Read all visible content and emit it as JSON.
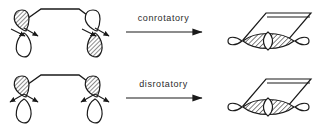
{
  "figure": {
    "background_color": "#ffffff",
    "line_color": "#1a1a1a",
    "text_color": "#2b2b2b",
    "width": 323,
    "height": 132
  },
  "rows": [
    {
      "id": "conrotatory",
      "label": "conrotatory",
      "reactant": {
        "name": "butadiene-conrotatory",
        "description": "open-chain diene with two terminal p orbitals",
        "left_orbital": {
          "shaded_lobe": "top",
          "rotation_arrows": [
            "down-right",
            "right"
          ]
        },
        "right_orbital": {
          "shaded_lobe": "bottom",
          "rotation_arrows": [
            "down-right",
            "right"
          ]
        }
      },
      "product": {
        "name": "cyclobutene-conrotatory",
        "description": "ring product with sigma bond lens and terminal lobes",
        "sigma_lobe_fill": "hatched",
        "terminal_lobe_fill": "open"
      }
    },
    {
      "id": "disrotatory",
      "label": "disrotatory",
      "reactant": {
        "name": "butadiene-disrotatory",
        "description": "open-chain diene with two terminal p orbitals",
        "left_orbital": {
          "shaded_lobe": "top",
          "rotation_arrows": [
            "down-left",
            "down-right"
          ]
        },
        "right_orbital": {
          "shaded_lobe": "top",
          "rotation_arrows": [
            "down-left",
            "left"
          ]
        }
      },
      "product": {
        "name": "cyclobutene-disrotatory",
        "description": "ring product with sigma bond lens and terminal lobes",
        "sigma_lobe_fill": "hatched",
        "terminal_lobe_fill": "open"
      }
    }
  ]
}
